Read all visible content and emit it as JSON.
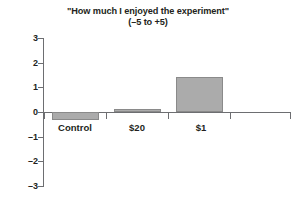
{
  "chart_data": {
    "type": "bar",
    "title": "\"How much I enjoyed the experiment\"",
    "subtitle": "(–5 to +5)",
    "xlabel": "",
    "ylabel": "",
    "categories": [
      "Control",
      "$20",
      "$1"
    ],
    "values": [
      -0.33,
      0.12,
      1.42
    ],
    "series": [
      {
        "name": "Enjoyment rating",
        "values": [
          -0.33,
          0.12,
          1.42
        ]
      }
    ],
    "ylim": [
      -3,
      3
    ],
    "yticks": [
      3,
      2,
      1,
      0,
      -1,
      -2,
      -3
    ],
    "ytick_labels": [
      "3",
      "2",
      "1",
      "0",
      "–1",
      "–2",
      "–3"
    ],
    "grid": false,
    "legend": null,
    "legend_position": "none",
    "bar_color": "#ababab",
    "bar_edge_color": "#8a8a8a",
    "axis_color": "#6d6e71",
    "text_color": "#231f20",
    "background_color": "#ffffff",
    "annotations": []
  }
}
